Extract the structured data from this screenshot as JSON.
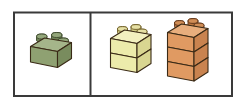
{
  "figure": {
    "background_color": "#ffffff",
    "frame_color": "#3a3a3a",
    "width": 245,
    "height": 104
  },
  "panels": [
    {
      "id": "left-panel",
      "name": "single-brick-panel",
      "x": 14,
      "y": 12,
      "width": 76,
      "height": 84,
      "stacks": [
        {
          "id": "green-stack",
          "name": "green-brick-stack",
          "color_label": "green",
          "count": 1,
          "fill_front": "#8fa172",
          "fill_side": "#798c5e",
          "fill_top": "#a5b58a",
          "stud_fill": "#6f8256",
          "outline": "#3d4a2c"
        }
      ]
    },
    {
      "id": "right-panel",
      "name": "stacked-bricks-panel",
      "x": 92,
      "y": 12,
      "width": 140,
      "height": 84,
      "stacks": [
        {
          "id": "yellow-stack",
          "name": "yellow-brick-stack",
          "color_label": "yellow",
          "count": 2,
          "fill_front": "#ecebab",
          "fill_side": "#d9d691",
          "fill_top": "#f2f0bf",
          "stud_fill": "#cfc982",
          "outline": "#6b5a24"
        },
        {
          "id": "orange-stack",
          "name": "orange-brick-stack",
          "color_label": "orange",
          "count": 3,
          "fill_front": "#e09a62",
          "fill_side": "#c9834f",
          "fill_top": "#e8ae7d",
          "stud_fill": "#b9743f",
          "outline": "#5c3317"
        }
      ]
    }
  ]
}
